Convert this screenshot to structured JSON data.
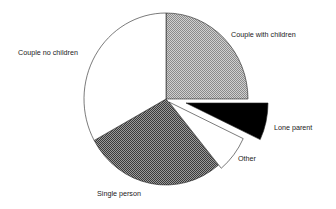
{
  "chart_data": {
    "type": "pie",
    "title": "",
    "start": "12 o'clock, clockwise",
    "legend": "none (direct labels)",
    "slices": [
      {
        "label": "Couple with children",
        "value": 25,
        "fill": "light-checker",
        "exploded": false
      },
      {
        "label": "Lone parent",
        "value": 7,
        "fill": "black",
        "exploded": true
      },
      {
        "label": "Other",
        "value": 7,
        "fill": "white",
        "exploded": true
      },
      {
        "label": "Single person",
        "value": 28,
        "fill": "dark-checker",
        "exploded": false
      },
      {
        "label": "Couple no children",
        "value": 33,
        "fill": "white",
        "exploded": false
      }
    ],
    "unit": "percent (estimated from angles)"
  },
  "colors": {
    "outline": "#222222",
    "black_fill": "#000000",
    "white_fill": "#ffffff",
    "light_checker_a": "#8a8a8a",
    "light_checker_b": "#d0d0d0",
    "dark_checker_a": "#3a3a3a",
    "dark_checker_b": "#9a9a9a"
  }
}
